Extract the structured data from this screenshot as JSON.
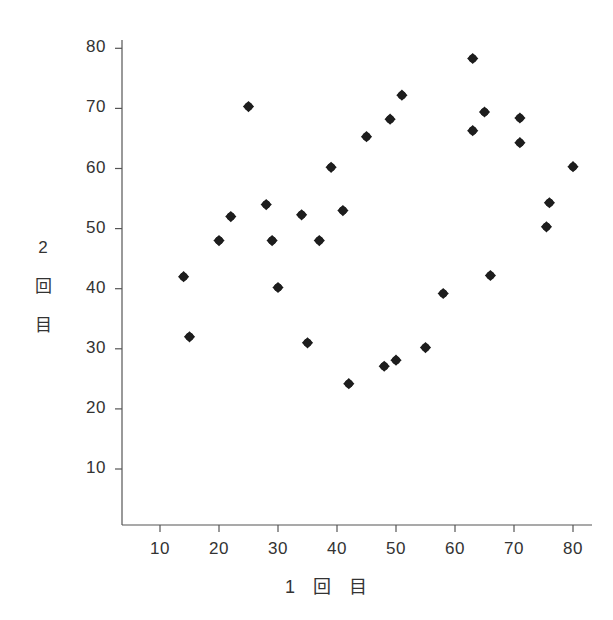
{
  "chart_data": {
    "type": "scatter",
    "title": "",
    "xlabel": "1 回 目",
    "ylabel": "2 回 目",
    "xlabel_parts": [
      "1",
      "回",
      "目"
    ],
    "ylabel_parts": [
      "2",
      "回",
      "目"
    ],
    "xlim": [
      5,
      84
    ],
    "ylim": [
      4,
      80
    ],
    "xticks": [
      10,
      20,
      30,
      40,
      50,
      60,
      70,
      80
    ],
    "yticks": [
      10,
      20,
      30,
      40,
      50,
      60,
      70,
      80
    ],
    "xtick_labels": [
      "10",
      "20",
      "30",
      "40",
      "50",
      "60",
      "70",
      "80"
    ],
    "ytick_labels": [
      "10",
      "20",
      "30",
      "40",
      "50",
      "60",
      "70",
      "80"
    ],
    "grid": false,
    "legend": false,
    "marker": "filled-diamond",
    "marker_color": "#1d1d1d",
    "marker_size": 8,
    "axis_color": "#555555",
    "background": "#ffffff",
    "n_points": 31,
    "points": [
      {
        "x": 14,
        "y": 42
      },
      {
        "x": 15,
        "y": 32
      },
      {
        "x": 20,
        "y": 48
      },
      {
        "x": 22,
        "y": 52
      },
      {
        "x": 25,
        "y": 70.3
      },
      {
        "x": 28,
        "y": 54
      },
      {
        "x": 29,
        "y": 48
      },
      {
        "x": 30,
        "y": 40.2
      },
      {
        "x": 34,
        "y": 52.3
      },
      {
        "x": 35,
        "y": 31
      },
      {
        "x": 37,
        "y": 48
      },
      {
        "x": 39,
        "y": 60.2
      },
      {
        "x": 41,
        "y": 53
      },
      {
        "x": 42,
        "y": 24.2
      },
      {
        "x": 45,
        "y": 65.3
      },
      {
        "x": 48,
        "y": 27.1
      },
      {
        "x": 49,
        "y": 68.2
      },
      {
        "x": 50,
        "y": 28.1
      },
      {
        "x": 51,
        "y": 72.2
      },
      {
        "x": 55,
        "y": 30.2
      },
      {
        "x": 58,
        "y": 39.2
      },
      {
        "x": 63,
        "y": 78.3
      },
      {
        "x": 63,
        "y": 66.3
      },
      {
        "x": 65,
        "y": 69.4
      },
      {
        "x": 66,
        "y": 42.2
      },
      {
        "x": 71,
        "y": 68.4
      },
      {
        "x": 71,
        "y": 64.3
      },
      {
        "x": 75.5,
        "y": 50.3
      },
      {
        "x": 76,
        "y": 54.3
      },
      {
        "x": 80,
        "y": 60.3
      }
    ]
  }
}
